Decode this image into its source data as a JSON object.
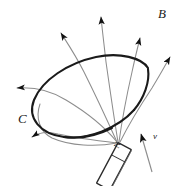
{
  "figure": {
    "background_color": "#ffffff",
    "width": 184,
    "height": 186,
    "labels": {
      "field_label": "B",
      "loop_label": "C",
      "velocity_label": "v",
      "pole_label": "N"
    },
    "colors": {
      "loop_stroke": "#1a1a1a",
      "field_line_stroke": "#8a8a8a",
      "arrow_fill": "#111111",
      "magnet_stroke": "#2b2b2b",
      "magnet_fill": "#ffffff",
      "text": "#1a1a1a"
    },
    "elements": {
      "loop_name": "conducting-loop-C",
      "magnet_name": "bar-magnet",
      "velocity_arrow_name": "velocity-arrow",
      "field_lines_name": "magnetic-field-lines"
    },
    "field_line_count": 7,
    "arrow_count": 7
  }
}
